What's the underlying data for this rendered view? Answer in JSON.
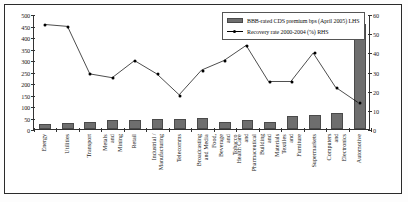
{
  "chart_data": {
    "type": "bar",
    "title": "",
    "subtitle": "",
    "xlabel": "",
    "ylabel": "",
    "grid": false,
    "legend_position": "top-right",
    "categories": [
      "Energy",
      "Utilities",
      "Transport",
      "Metals and\nMining",
      "Retail",
      "Industrial /\nManufacturing",
      "Telecomms",
      "Broadcasting\nand Media",
      "Food, Beverage\nand Tobacco",
      "Health Care and\nPharmaceutical",
      "Building and\nMaterials",
      "Textiles and\nFurniture",
      "Supermarkets",
      "Computers and\nElectronics",
      "Automotive"
    ],
    "series": [
      {
        "name": "BBB-rated CDS premium bps (April 2005) LHS",
        "type": "bar",
        "axis": "left",
        "color": "#6e6e6e",
        "values": [
          22,
          28,
          32,
          38,
          40,
          42,
          44,
          46,
          30,
          38,
          32,
          55,
          62,
          70,
          455
        ]
      },
      {
        "name": "Recovery rate 2000-2004 (%) RHS",
        "type": "line",
        "axis": "right",
        "color": "#000000",
        "values": [
          55,
          54,
          29,
          27,
          36,
          29,
          18,
          31,
          36,
          44,
          25,
          25,
          40,
          22,
          14
        ]
      }
    ],
    "left_axis": {
      "label": "",
      "ticks": [
        0,
        50,
        100,
        150,
        200,
        250,
        300,
        350,
        400,
        450,
        500
      ],
      "ylim": [
        0,
        500
      ]
    },
    "right_axis": {
      "label": "",
      "ticks": [
        0,
        10,
        20,
        30,
        40,
        50,
        60
      ],
      "ylim": [
        0,
        60
      ]
    },
    "legend": [
      "BBB-rated CDS premium bps (April 2005) LHS",
      "Recovery rate 2000-2004 (%) RHS"
    ]
  }
}
